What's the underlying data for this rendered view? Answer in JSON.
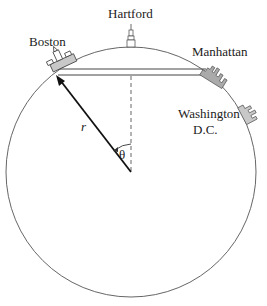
{
  "diagram": {
    "labels": {
      "boston": "Boston",
      "hartford": "Hartford",
      "manhattan": "Manhattan",
      "washington_line1": "Washington",
      "washington_line2": "D.C.",
      "radius": "r",
      "angle": "θ"
    },
    "colors": {
      "stroke": "#555555",
      "arrow": "#111111",
      "building_fill": "#c8c8c8",
      "text": "#222222"
    }
  }
}
